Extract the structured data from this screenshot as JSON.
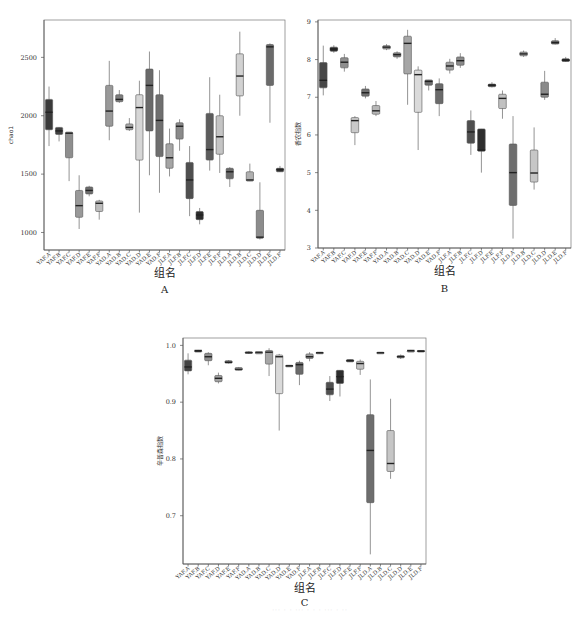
{
  "figure": {
    "caption": "··· · · ··· · · · ··· · ··"
  },
  "chart_data": [
    {
      "id": "A",
      "type": "box",
      "panel_label": "A",
      "title": "",
      "xlabel": "组名",
      "ylabel": "chao1",
      "ylim": [
        850,
        2820
      ],
      "yticks": [
        1000,
        1500,
        2000,
        2500
      ],
      "ytick_labels": [
        "1000",
        "1500",
        "2000",
        "2500"
      ],
      "grid": false,
      "legend": null,
      "categories": [
        "YAF.A",
        "YAF.B",
        "YAF.C",
        "YAF.D",
        "YAF.E",
        "YAF.F",
        "YAD.A",
        "YAD.B",
        "YAD.C",
        "YAD.D",
        "YAD.E",
        "YAD.F",
        "JLF.A",
        "JLF.B",
        "JLF.C",
        "JLF.D",
        "JLF.E",
        "JLF.F",
        "JLD.A",
        "JLD.B",
        "JLD.C",
        "JLD.D",
        "JLD.E",
        "JLD.F"
      ],
      "boxes": [
        {
          "min": 1740,
          "q1": 1880,
          "median": 2030,
          "q3": 2140,
          "max": 2250,
          "color": "#3a3a3a"
        },
        {
          "min": 1780,
          "q1": 1840,
          "median": 1870,
          "q3": 1900,
          "max": 1900,
          "color": "#404040"
        },
        {
          "min": 1440,
          "q1": 1640,
          "median": 1850,
          "q3": 1860,
          "max": 1860,
          "color": "#8e8e8e"
        },
        {
          "min": 1030,
          "q1": 1130,
          "median": 1230,
          "q3": 1360,
          "max": 1490,
          "color": "#999999"
        },
        {
          "min": 1310,
          "q1": 1330,
          "median": 1360,
          "q3": 1390,
          "max": 1400,
          "color": "#6e6e6e"
        },
        {
          "min": 1110,
          "q1": 1180,
          "median": 1250,
          "q3": 1270,
          "max": 1280,
          "color": "#bdbdbd"
        },
        {
          "min": 1790,
          "q1": 1910,
          "median": 2040,
          "q3": 2260,
          "max": 2470,
          "color": "#999999"
        },
        {
          "min": 2110,
          "q1": 2120,
          "median": 2140,
          "q3": 2180,
          "max": 2220,
          "color": "#7d7d7d"
        },
        {
          "min": 1870,
          "q1": 1880,
          "median": 1900,
          "q3": 1930,
          "max": 1980,
          "color": "#a8a8a8"
        },
        {
          "min": 1170,
          "q1": 1620,
          "median": 2070,
          "q3": 2180,
          "max": 2300,
          "color": "#d6d6d6"
        },
        {
          "min": 1490,
          "q1": 1870,
          "median": 2260,
          "q3": 2400,
          "max": 2550,
          "color": "#6a6a6a"
        },
        {
          "min": 1340,
          "q1": 1650,
          "median": 1960,
          "q3": 2180,
          "max": 2390,
          "color": "#6f6f6f"
        },
        {
          "min": 1480,
          "q1": 1550,
          "median": 1640,
          "q3": 1760,
          "max": 1890,
          "color": "#a5a5a5"
        },
        {
          "min": 1700,
          "q1": 1800,
          "median": 1910,
          "q3": 1940,
          "max": 1970,
          "color": "#8a8a8a"
        },
        {
          "min": 1140,
          "q1": 1290,
          "median": 1450,
          "q3": 1600,
          "max": 1740,
          "color": "#4f4f4f"
        },
        {
          "min": 1070,
          "q1": 1110,
          "median": 1150,
          "q3": 1180,
          "max": 1210,
          "color": "#2c2c2c"
        },
        {
          "min": 1530,
          "q1": 1620,
          "median": 1710,
          "q3": 2020,
          "max": 2330,
          "color": "#5c5c5c"
        },
        {
          "min": 1510,
          "q1": 1670,
          "median": 1820,
          "q3": 2000,
          "max": 2180,
          "color": "#c4c4c4"
        },
        {
          "min": 1390,
          "q1": 1460,
          "median": 1520,
          "q3": 1550,
          "max": 1560,
          "color": "#6a6a6a"
        },
        {
          "min": 2000,
          "q1": 2170,
          "median": 2340,
          "q3": 2530,
          "max": 2720,
          "color": "#d2d2d2"
        },
        {
          "min": 1440,
          "q1": 1440,
          "median": 1450,
          "q3": 1520,
          "max": 1590,
          "color": "#b0b0b0"
        },
        {
          "min": 940,
          "q1": 950,
          "median": 960,
          "q3": 1190,
          "max": 1430,
          "color": "#8c8c8c"
        },
        {
          "min": 1940,
          "q1": 2260,
          "median": 2590,
          "q3": 2610,
          "max": 2620,
          "color": "#6a6a6a"
        },
        {
          "min": 1520,
          "q1": 1520,
          "median": 1540,
          "q3": 1550,
          "max": 1570,
          "color": "#2f2f2f"
        }
      ]
    },
    {
      "id": "B",
      "type": "box",
      "panel_label": "B",
      "title": "",
      "xlabel": "组名",
      "ylabel": "香农指数",
      "ylim": [
        3,
        9.05
      ],
      "yticks": [
        3,
        4,
        5,
        6,
        7,
        8,
        9
      ],
      "ytick_labels": [
        "3",
        "4",
        "5",
        "6",
        "7",
        "8",
        "9"
      ],
      "grid": false,
      "legend": null,
      "categories": [
        "YAF.A",
        "YAF.B",
        "YAF.C",
        "YAF.D",
        "YAF.E",
        "YAF.F",
        "YAD.A",
        "YAD.B",
        "YAD.C",
        "YAD.D",
        "YAD.E",
        "YAD.F",
        "JLF.A",
        "JLF.B",
        "JLF.C",
        "JLF.D",
        "JLF.E",
        "JLF.F",
        "JLD.A",
        "JLD.B",
        "JLD.C",
        "JLD.D",
        "JLD.E",
        "JLD.F"
      ],
      "boxes": [
        {
          "min": 7.05,
          "q1": 7.25,
          "median": 7.45,
          "q3": 7.92,
          "max": 8.37,
          "color": "#474747"
        },
        {
          "min": 8.18,
          "q1": 8.22,
          "median": 8.28,
          "q3": 8.33,
          "max": 8.38,
          "color": "#2a2a2a"
        },
        {
          "min": 7.68,
          "q1": 7.78,
          "median": 7.93,
          "q3": 8.05,
          "max": 8.15,
          "color": "#8e8e8e"
        },
        {
          "min": 5.73,
          "q1": 6.06,
          "median": 6.38,
          "q3": 6.46,
          "max": 6.5,
          "color": "#c9c9c9"
        },
        {
          "min": 6.97,
          "q1": 7.03,
          "median": 7.12,
          "q3": 7.22,
          "max": 7.3,
          "color": "#707070"
        },
        {
          "min": 6.5,
          "q1": 6.55,
          "median": 6.64,
          "q3": 6.78,
          "max": 6.9,
          "color": "#b8b8b8"
        },
        {
          "min": 8.25,
          "q1": 8.28,
          "median": 8.33,
          "q3": 8.37,
          "max": 8.41,
          "color": "#9a9a9a"
        },
        {
          "min": 8.02,
          "q1": 8.07,
          "median": 8.13,
          "q3": 8.18,
          "max": 8.22,
          "color": "#808080"
        },
        {
          "min": 6.8,
          "q1": 7.62,
          "median": 8.43,
          "q3": 8.62,
          "max": 8.79,
          "color": "#a6a6a6"
        },
        {
          "min": 5.6,
          "q1": 6.6,
          "median": 7.6,
          "q3": 7.72,
          "max": 7.82,
          "color": "#dadada"
        },
        {
          "min": 7.18,
          "q1": 7.32,
          "median": 7.42,
          "q3": 7.46,
          "max": 7.46,
          "color": "#6e6e6e"
        },
        {
          "min": 6.5,
          "q1": 6.83,
          "median": 7.2,
          "q3": 7.36,
          "max": 7.5,
          "color": "#6a6a6a"
        },
        {
          "min": 7.63,
          "q1": 7.72,
          "median": 7.83,
          "q3": 7.93,
          "max": 8.02,
          "color": "#9f9f9f"
        },
        {
          "min": 7.78,
          "q1": 7.85,
          "median": 7.97,
          "q3": 8.07,
          "max": 8.17,
          "color": "#8a8a8a"
        },
        {
          "min": 5.47,
          "q1": 5.78,
          "median": 6.08,
          "q3": 6.38,
          "max": 6.65,
          "color": "#4f4f4f"
        },
        {
          "min": 5.0,
          "q1": 5.57,
          "median": 5.6,
          "q3": 6.16,
          "max": 6.16,
          "color": "#2e2e2e"
        },
        {
          "min": 7.26,
          "q1": 7.28,
          "median": 7.32,
          "q3": 7.35,
          "max": 7.4,
          "color": "#3b3b3b"
        },
        {
          "min": 6.43,
          "q1": 6.7,
          "median": 6.97,
          "q3": 7.08,
          "max": 7.18,
          "color": "#c1c1c1"
        },
        {
          "min": 3.25,
          "q1": 4.13,
          "median": 5.0,
          "q3": 5.76,
          "max": 6.5,
          "color": "#6e6e6e"
        },
        {
          "min": 8.07,
          "q1": 8.1,
          "median": 8.15,
          "q3": 8.2,
          "max": 8.24,
          "color": "#a1a1a1"
        },
        {
          "min": 4.55,
          "q1": 4.75,
          "median": 4.99,
          "q3": 5.6,
          "max": 6.2,
          "color": "#c6c6c6"
        },
        {
          "min": 6.93,
          "q1": 7.0,
          "median": 7.08,
          "q3": 7.4,
          "max": 7.7,
          "color": "#8a8a8a"
        },
        {
          "min": 8.4,
          "q1": 8.41,
          "median": 8.45,
          "q3": 8.5,
          "max": 8.57,
          "color": "#6a6a6a"
        },
        {
          "min": 7.94,
          "q1": 7.95,
          "median": 7.98,
          "q3": 8.02,
          "max": 8.07,
          "color": "#222222"
        }
      ]
    },
    {
      "id": "C",
      "type": "box",
      "panel_label": "C",
      "title": "",
      "xlabel": "组名",
      "ylabel": "辛普森指数",
      "ylim": [
        0.615,
        1.013
      ],
      "yticks": [
        0.7,
        0.8,
        0.9,
        1.0
      ],
      "ytick_labels": [
        "0.7",
        "0.8",
        "0.9",
        "1.0"
      ],
      "grid": false,
      "legend": null,
      "categories": [
        "YAF.A",
        "YAF.B",
        "YAF.C",
        "YAF.D",
        "YAF.E",
        "YAF.F",
        "YAD.A",
        "YAD.B",
        "YAD.C",
        "YAD.D",
        "YAD.E",
        "YAD.F",
        "JLF.A",
        "JLF.B",
        "JLF.C",
        "JLF.D",
        "JLF.E",
        "JLF.F",
        "JLD.A",
        "JLD.B",
        "JLD.C",
        "JLD.D",
        "JLD.E",
        "JLD.F"
      ],
      "boxes": [
        {
          "min": 0.949,
          "q1": 0.955,
          "median": 0.962,
          "q3": 0.974,
          "max": 0.986,
          "color": "#434343"
        },
        {
          "min": 0.99,
          "q1": 0.99,
          "median": 0.991,
          "q3": 0.991,
          "max": 0.992,
          "color": "#2a2a2a"
        },
        {
          "min": 0.965,
          "q1": 0.973,
          "median": 0.98,
          "q3": 0.986,
          "max": 0.988,
          "color": "#8e8e8e"
        },
        {
          "min": 0.933,
          "q1": 0.936,
          "median": 0.942,
          "q3": 0.947,
          "max": 0.952,
          "color": "#a0a0a0"
        },
        {
          "min": 0.968,
          "q1": 0.969,
          "median": 0.97,
          "q3": 0.973,
          "max": 0.974,
          "color": "#6a6a6a"
        },
        {
          "min": 0.956,
          "q1": 0.956,
          "median": 0.958,
          "q3": 0.961,
          "max": 0.962,
          "color": "#b8b8b8"
        },
        {
          "min": 0.985,
          "q1": 0.986,
          "median": 0.987,
          "q3": 0.989,
          "max": 0.99,
          "color": "#9a9a9a"
        },
        {
          "min": 0.987,
          "q1": 0.987,
          "median": 0.988,
          "q3": 0.988,
          "max": 0.988,
          "color": "#7d7d7d"
        },
        {
          "min": 0.946,
          "q1": 0.967,
          "median": 0.988,
          "q3": 0.991,
          "max": 0.995,
          "color": "#a6a6a6"
        },
        {
          "min": 0.85,
          "q1": 0.915,
          "median": 0.98,
          "q3": 0.983,
          "max": 0.985,
          "color": "#dadada"
        },
        {
          "min": 0.964,
          "q1": 0.964,
          "median": 0.964,
          "q3": 0.965,
          "max": 0.965,
          "color": "#6e6e6e"
        },
        {
          "min": 0.93,
          "q1": 0.949,
          "median": 0.966,
          "q3": 0.97,
          "max": 0.973,
          "color": "#6a6a6a"
        },
        {
          "min": 0.972,
          "q1": 0.977,
          "median": 0.98,
          "q3": 0.985,
          "max": 0.988,
          "color": "#9f9f9f"
        },
        {
          "min": 0.985,
          "q1": 0.986,
          "median": 0.987,
          "q3": 0.988,
          "max": 0.988,
          "color": "#8a8a8a"
        },
        {
          "min": 0.902,
          "q1": 0.913,
          "median": 0.923,
          "q3": 0.935,
          "max": 0.946,
          "color": "#4f4f4f"
        },
        {
          "min": 0.91,
          "q1": 0.933,
          "median": 0.945,
          "q3": 0.956,
          "max": 0.956,
          "color": "#2e2e2e"
        },
        {
          "min": 0.971,
          "q1": 0.971,
          "median": 0.973,
          "q3": 0.975,
          "max": 0.975,
          "color": "#3b3b3b"
        },
        {
          "min": 0.948,
          "q1": 0.958,
          "median": 0.968,
          "q3": 0.972,
          "max": 0.975,
          "color": "#c1c1c1"
        },
        {
          "min": 0.632,
          "q1": 0.723,
          "median": 0.815,
          "q3": 0.878,
          "max": 0.94,
          "color": "#6e6e6e"
        },
        {
          "min": 0.986,
          "q1": 0.987,
          "median": 0.987,
          "q3": 0.988,
          "max": 0.988,
          "color": "#a1a1a1"
        },
        {
          "min": 0.765,
          "q1": 0.778,
          "median": 0.792,
          "q3": 0.85,
          "max": 0.906,
          "color": "#c6c6c6"
        },
        {
          "min": 0.976,
          "q1": 0.978,
          "median": 0.98,
          "q3": 0.982,
          "max": 0.984,
          "color": "#8a8a8a"
        },
        {
          "min": 0.989,
          "q1": 0.99,
          "median": 0.991,
          "q3": 0.991,
          "max": 0.992,
          "color": "#6a6a6a"
        },
        {
          "min": 0.989,
          "q1": 0.99,
          "median": 0.99,
          "q3": 0.991,
          "max": 0.991,
          "color": "#222222"
        }
      ]
    }
  ],
  "layout": {
    "A": {
      "plot_left": 44,
      "plot_top": 20,
      "plot_right": 285,
      "plot_bottom": 250,
      "ytick_x": 37,
      "ylabel_x": 13,
      "xlabel_y": 277,
      "letter_y": 293
    },
    "B": {
      "plot_left": 26,
      "plot_top": 20,
      "plot_right": 279,
      "plot_bottom": 248,
      "ytick_x": 19,
      "ylabel_x": 8,
      "xlabel_y": 275,
      "letter_y": 292
    },
    "C": {
      "plot_left": 43,
      "plot_top": 18,
      "plot_right": 286,
      "plot_bottom": 244,
      "ytick_x": 36,
      "ylabel_x": 22,
      "xlabel_y": 272,
      "letter_y": 286
    }
  }
}
